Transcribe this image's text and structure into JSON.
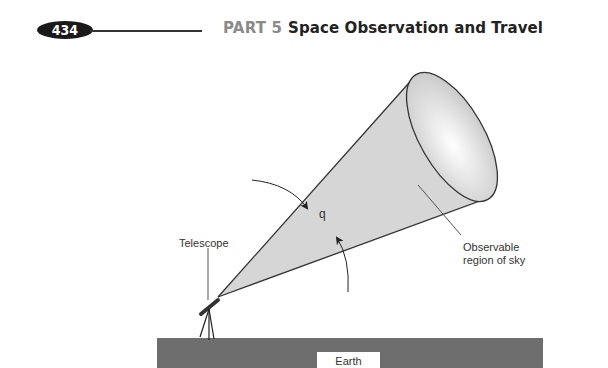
{
  "header": {
    "page_number": "434",
    "part_label": "PART 5",
    "chapter_title": "Space Observation and Travel"
  },
  "figure": {
    "labels": {
      "telescope": "Telescope",
      "angle_symbol": "q",
      "observable_line1": "Observable",
      "observable_line2": "region of sky",
      "earth": "Earth"
    },
    "colors": {
      "cone_fill": "#d4d4d4",
      "ground_fill": "#6e6e6e",
      "line": "#333333"
    }
  }
}
